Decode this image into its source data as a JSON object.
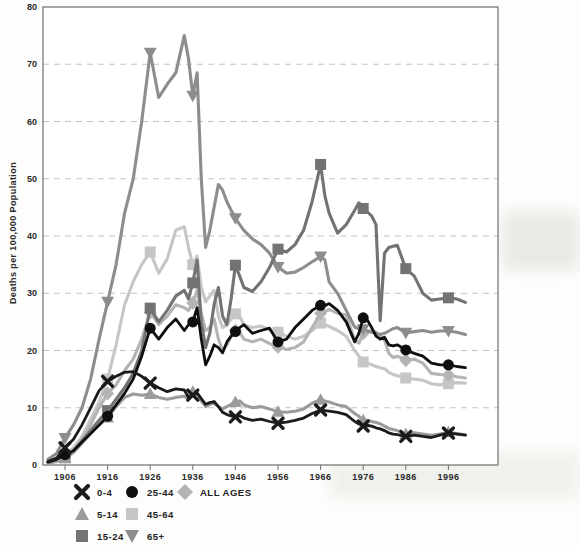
{
  "figure": {
    "ylabel": "Deaths per 100,000 Population"
  },
  "colors": {
    "axis": "#6e6e6e",
    "grid": "#c3c3c3",
    "text": "#2b2b2b",
    "background": "#fdfdfc"
  },
  "chart_data": {
    "type": "line",
    "title": "",
    "xlabel": "",
    "ylabel": "Deaths per 100,000 Population",
    "ylim": [
      0,
      80
    ],
    "y_ticks": [
      0,
      10,
      20,
      30,
      40,
      50,
      60,
      70,
      80
    ],
    "x_ticks": [
      1906,
      1916,
      1926,
      1936,
      1946,
      1956,
      1966,
      1976,
      1986,
      1996
    ],
    "grid": "horizontal-dashed",
    "legend_position": "bottom-left",
    "marker_years": [
      1906,
      1916,
      1926,
      1936,
      1946,
      1956,
      1966,
      1976,
      1986,
      1996
    ],
    "years": [
      1902,
      1904,
      1906,
      1908,
      1910,
      1912,
      1914,
      1916,
      1918,
      1920,
      1922,
      1924,
      1926,
      1928,
      1930,
      1932,
      1934,
      1935,
      1936,
      1937,
      1938,
      1939,
      1940,
      1941,
      1942,
      1943,
      1944,
      1945,
      1946,
      1947,
      1948,
      1950,
      1952,
      1954,
      1956,
      1958,
      1960,
      1962,
      1964,
      1966,
      1967,
      1968,
      1970,
      1972,
      1974,
      1975,
      1976,
      1977,
      1978,
      1979,
      1980,
      1981,
      1982,
      1983,
      1984,
      1986,
      1988,
      1990,
      1992,
      1994,
      1996,
      1998,
      2000
    ],
    "series": [
      {
        "name": "0-4",
        "marker": "x",
        "color": "#1b1b1b",
        "values": [
          0.6,
          1.2,
          3.0,
          4.5,
          7.0,
          10.0,
          13.0,
          14.6,
          15.5,
          16.2,
          16.3,
          15.5,
          14.3,
          13.5,
          12.8,
          13.3,
          13.1,
          11.8,
          12.2,
          12.6,
          11.6,
          10.6,
          10.9,
          11.1,
          10.2,
          9.2,
          8.8,
          8.6,
          8.4,
          8.6,
          8.2,
          7.8,
          8.0,
          7.6,
          7.3,
          7.5,
          7.8,
          8.2,
          9.0,
          9.6,
          9.5,
          9.4,
          9.2,
          8.8,
          7.6,
          7.2,
          6.8,
          6.9,
          6.8,
          6.5,
          6.3,
          6.0,
          5.6,
          5.4,
          5.3,
          5.0,
          5.2,
          5.0,
          4.8,
          5.2,
          5.6,
          5.4,
          5.2
        ]
      },
      {
        "name": "5-14",
        "marker": "triangle-up",
        "color": "#9b9b9b",
        "values": [
          0.3,
          0.6,
          1.2,
          2.2,
          3.8,
          5.5,
          7.0,
          8.3,
          10.2,
          11.8,
          12.4,
          12.2,
          12.4,
          11.8,
          11.5,
          11.8,
          12.0,
          11.5,
          12.8,
          12.4,
          11.2,
          10.2,
          10.6,
          10.8,
          10.2,
          9.8,
          10.2,
          10.6,
          11.0,
          11.2,
          10.5,
          10.0,
          10.2,
          9.8,
          9.3,
          9.2,
          9.4,
          9.8,
          10.8,
          11.4,
          11.2,
          11.0,
          10.5,
          10.2,
          9.0,
          8.5,
          7.8,
          7.8,
          7.6,
          7.4,
          7.2,
          6.8,
          6.4,
          6.2,
          6.0,
          5.4,
          5.6,
          5.4,
          5.2,
          5.4,
          5.7,
          5.5,
          5.3
        ]
      },
      {
        "name": "15-24",
        "marker": "square",
        "color": "#737373",
        "values": [
          0.4,
          0.9,
          1.3,
          2.5,
          4.2,
          6.0,
          7.8,
          9.5,
          11.5,
          13.5,
          16.0,
          20.0,
          27.4,
          25.0,
          27.0,
          29.5,
          30.5,
          29.0,
          31.8,
          35.8,
          25.0,
          20.5,
          23.0,
          28.0,
          31.0,
          26.0,
          24.5,
          29.0,
          34.9,
          33.0,
          31.0,
          30.3,
          32.0,
          34.5,
          37.7,
          37.2,
          38.5,
          41.0,
          46.0,
          52.5,
          47.0,
          44.0,
          40.5,
          42.0,
          44.5,
          45.8,
          44.8,
          44.2,
          43.5,
          42.0,
          25.2,
          37.0,
          38.0,
          38.2,
          38.4,
          34.3,
          33.0,
          30.0,
          28.8,
          29.0,
          29.2,
          29.0,
          28.4
        ]
      },
      {
        "name": "25-44",
        "marker": "circle",
        "color": "#0f0f0f",
        "values": [
          0.5,
          1.0,
          1.8,
          2.5,
          4.0,
          5.5,
          7.0,
          8.5,
          10.5,
          12.5,
          15.0,
          19.0,
          23.9,
          22.0,
          24.0,
          25.5,
          23.5,
          24.5,
          25.0,
          27.5,
          22.0,
          17.5,
          19.0,
          21.0,
          20.5,
          19.6,
          21.5,
          22.5,
          23.3,
          24.0,
          24.5,
          23.0,
          23.5,
          23.9,
          21.5,
          22.0,
          24.0,
          25.5,
          27.0,
          27.9,
          27.8,
          28.2,
          27.0,
          25.0,
          21.5,
          23.0,
          25.7,
          25.3,
          24.0,
          22.5,
          22.0,
          22.3,
          21.0,
          20.8,
          21.0,
          20.1,
          19.5,
          19.0,
          17.8,
          17.5,
          17.5,
          17.2,
          17.0
        ]
      },
      {
        "name": "45-64",
        "marker": "square",
        "color": "#c6c6c6",
        "values": [
          0.6,
          1.0,
          1.8,
          3.0,
          5.0,
          8.0,
          11.0,
          15.0,
          21.0,
          28.0,
          32.0,
          35.0,
          37.2,
          33.5,
          36.0,
          41.0,
          41.6,
          38.0,
          35.0,
          36.5,
          31.0,
          28.5,
          29.5,
          30.5,
          26.0,
          24.0,
          24.5,
          25.5,
          26.4,
          26.0,
          24.5,
          24.0,
          24.3,
          23.6,
          23.2,
          22.5,
          22.0,
          22.5,
          23.5,
          24.8,
          24.5,
          24.2,
          23.5,
          22.5,
          20.0,
          19.0,
          18.0,
          17.8,
          17.5,
          17.2,
          17.0,
          16.8,
          16.2,
          15.8,
          15.6,
          15.2,
          15.0,
          14.8,
          14.2,
          14.0,
          14.2,
          14.4,
          14.3
        ]
      },
      {
        "name": "65+",
        "marker": "triangle-down",
        "color": "#8d8d8d",
        "values": [
          1.0,
          2.0,
          4.7,
          7.0,
          10.0,
          15.0,
          22.0,
          28.5,
          35.0,
          44.0,
          50.0,
          60.0,
          72.0,
          64.2,
          66.5,
          68.5,
          75.0,
          71.0,
          64.5,
          68.5,
          50.0,
          38.0,
          41.0,
          45.0,
          49.0,
          48.0,
          46.0,
          44.5,
          43.1,
          42.0,
          41.0,
          39.5,
          38.5,
          37.0,
          34.6,
          33.5,
          33.7,
          34.5,
          35.5,
          36.4,
          35.8,
          32.0,
          30.0,
          27.0,
          24.1,
          23.8,
          23.7,
          23.4,
          23.2,
          23.0,
          22.8,
          23.0,
          23.4,
          23.8,
          24.0,
          23.1,
          23.3,
          23.5,
          23.2,
          23.4,
          23.4,
          23.2,
          22.8
        ]
      },
      {
        "name": "ALL AGES",
        "marker": "diamond",
        "color": "#b4b4b4",
        "values": [
          0.4,
          0.8,
          1.5,
          2.5,
          4.5,
          7.0,
          10.0,
          12.5,
          14.0,
          16.5,
          18.5,
          22.0,
          26.7,
          24.5,
          26.0,
          28.0,
          27.5,
          27.0,
          28.3,
          30.5,
          26.5,
          23.5,
          24.0,
          25.5,
          22.0,
          20.0,
          21.0,
          22.5,
          23.5,
          23.2,
          22.0,
          21.5,
          22.0,
          21.2,
          20.6,
          20.2,
          20.5,
          21.5,
          24.0,
          26.5,
          26.8,
          27.2,
          26.5,
          26.2,
          21.8,
          21.3,
          23.0,
          23.3,
          23.5,
          23.2,
          22.5,
          21.8,
          19.5,
          18.8,
          19.0,
          18.3,
          18.5,
          17.8,
          16.0,
          15.8,
          15.7,
          15.4,
          15.2
        ]
      }
    ],
    "legend_columns": [
      [
        "0-4",
        "5-14",
        "15-24"
      ],
      [
        "25-44",
        "45-64",
        "65+"
      ],
      [
        "ALL AGES"
      ]
    ]
  }
}
